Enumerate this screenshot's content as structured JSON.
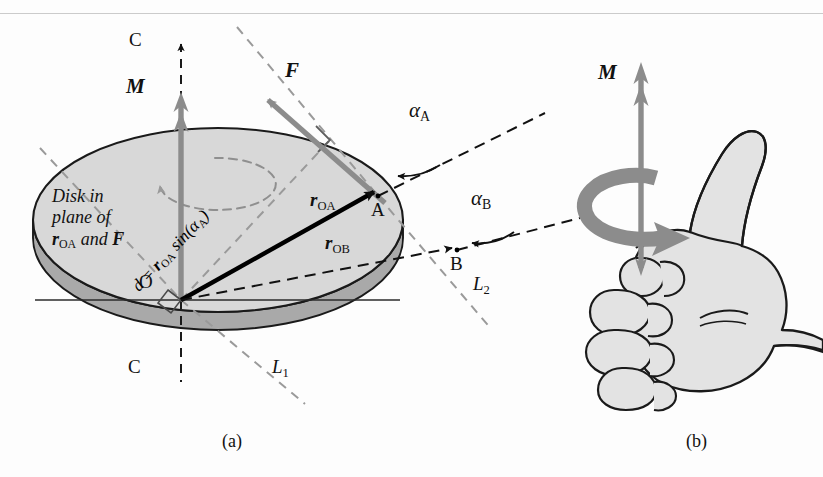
{
  "figure": {
    "panels": [
      {
        "id": "a",
        "caption": "(a)",
        "description": "Disk with moment vector M, force F at point A, position vectors r_OA and r_OB"
      },
      {
        "id": "b",
        "caption": "(b)",
        "description": "Right hand with thumb up showing right-hand rule for moment M"
      }
    ]
  },
  "panel_a": {
    "moment_vector_label": "M",
    "force_vector_label": "F",
    "axis_label_top": "C",
    "axis_label_bottom": "C",
    "origin_label": "O",
    "point_a_label": "A",
    "point_b_label": "B",
    "line1_label": "L",
    "line1_sub": "1",
    "line2_label": "L",
    "line2_sub": "2",
    "angle_a": "α",
    "angle_a_sub": "A",
    "angle_b": "α",
    "angle_b_sub": "B",
    "r_oa": {
      "symbol": "r",
      "sub": "OA"
    },
    "r_ob": {
      "symbol": "r",
      "sub": "OB"
    },
    "perp_distance": {
      "lhs": "d",
      "eq": " = ",
      "symbol": "r",
      "sub": "OA",
      "func": " sin(",
      "angle": "α",
      "angle_sub": "A",
      "close": ")"
    },
    "note_lines": [
      "Disk in",
      "plane of"
    ],
    "note_last_line": {
      "symbol": "r",
      "sub": "OA",
      "conj": " and ",
      "force": "F"
    }
  },
  "panel_b": {
    "moment_vector_label": "M"
  },
  "colors": {
    "vector_gray": "#8c8c8c",
    "arrow_dark_gray": "#7d7d7d",
    "disk_face": "#d8d8d8",
    "disk_edge_band": "#a9a9a9",
    "disk_outline": "#1a1a1a",
    "dashed_black": "#1a1a1a",
    "dashed_gray": "#9a9a9a",
    "solid_black": "#000000",
    "hand_fill": "#e3e3e3",
    "hand_outline": "#1a1a1a",
    "background": "#fdfdfd",
    "scan_artifact": "#b9b9b9"
  },
  "geometry": {
    "disk_center": {
      "x": 218,
      "y": 220
    },
    "disk_rx": 185,
    "disk_ry": 92,
    "disk_thickness": 18,
    "origin": {
      "x": 181,
      "y": 300
    },
    "point_a": {
      "x": 378,
      "y": 196
    },
    "point_b": {
      "x": 457,
      "y": 250
    },
    "horizontal_line": {
      "x1": 35,
      "x2": 400,
      "y": 300
    }
  }
}
